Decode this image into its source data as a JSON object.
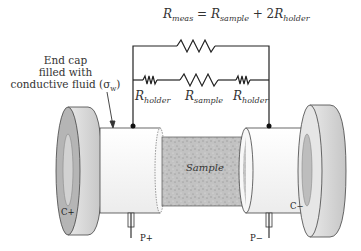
{
  "equation": {
    "lhs_symbol": "R",
    "lhs_sub": "meas",
    "equals": "=",
    "term1_symbol": "R",
    "term1_sub": "sample",
    "plus": "+",
    "term2_coef": "2",
    "term2_symbol": "R",
    "term2_sub": "holder"
  },
  "annotation": {
    "line1": "End cap",
    "line2": "filled with",
    "line3": "conductive fluid (σ",
    "line3_sub": "w",
    "line3_end": ")"
  },
  "resistor_labels": [
    {
      "symbol": "R",
      "sub": "holder"
    },
    {
      "symbol": "R",
      "sub": "sample"
    },
    {
      "symbol": "R",
      "sub": "holder"
    }
  ],
  "components": {
    "sample_label": "Sample",
    "left_electrode_label": "C+",
    "right_electrode_label": "C−",
    "left_probe_label": "P+",
    "right_probe_label": "P−"
  },
  "colors": {
    "wire": "#222222",
    "cap_face": "#b8b8b8",
    "cap_side": "#d4d4d4",
    "tube": "#f4f4f4",
    "sample": "#bdbdbd"
  }
}
